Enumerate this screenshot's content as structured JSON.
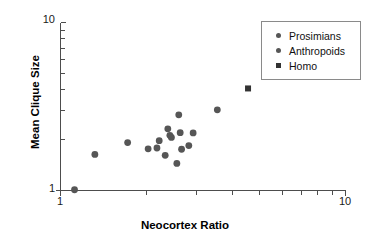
{
  "chart_data": {
    "type": "scatter",
    "title": "",
    "xlabel": "Neocortex Ratio",
    "ylabel": "Mean Clique Size",
    "xscale": "log",
    "yscale": "log",
    "xlim": [
      1,
      10
    ],
    "ylim": [
      1,
      10
    ],
    "grid": false,
    "xticks": [
      1,
      10
    ],
    "xtick_labels": [
      "1",
      "10"
    ],
    "xminor_ticks": [
      2,
      3,
      4,
      5,
      6,
      7,
      8,
      9
    ],
    "yticks": [
      1,
      10
    ],
    "ytick_labels": [
      "1",
      "10"
    ],
    "yminor_ticks": [
      2,
      3,
      4,
      5,
      6,
      7,
      8,
      9
    ],
    "legend_position": "upper right",
    "series": [
      {
        "name": "Prosimians",
        "marker": "circle",
        "color": "#565656",
        "points": [
          {
            "x": 1.12,
            "y": 1.01
          },
          {
            "x": 1.32,
            "y": 1.64
          },
          {
            "x": 1.72,
            "y": 1.93
          }
        ]
      },
      {
        "name": "Anthropoids",
        "marker": "circle",
        "color": "#565656",
        "points": [
          {
            "x": 2.03,
            "y": 1.77
          },
          {
            "x": 2.18,
            "y": 1.79
          },
          {
            "x": 2.22,
            "y": 1.98
          },
          {
            "x": 2.33,
            "y": 1.62
          },
          {
            "x": 2.38,
            "y": 2.33
          },
          {
            "x": 2.42,
            "y": 2.13
          },
          {
            "x": 2.45,
            "y": 2.07
          },
          {
            "x": 2.56,
            "y": 1.45
          },
          {
            "x": 2.6,
            "y": 2.82
          },
          {
            "x": 2.63,
            "y": 2.21
          },
          {
            "x": 2.66,
            "y": 1.76
          },
          {
            "x": 2.82,
            "y": 1.85
          },
          {
            "x": 2.92,
            "y": 2.2
          },
          {
            "x": 3.55,
            "y": 3.02
          }
        ]
      },
      {
        "name": "Homo",
        "marker": "square",
        "color": "#333333",
        "points": [
          {
            "x": 4.55,
            "y": 4.05
          }
        ]
      }
    ]
  },
  "legend": {
    "items": [
      {
        "label": "Prosimians",
        "marker": "circle"
      },
      {
        "label": "Anthropoids",
        "marker": "circle"
      },
      {
        "label": "Homo",
        "marker": "square"
      }
    ]
  },
  "axes": {
    "y_top_label": "10",
    "y_bottom_label": "1",
    "x_left_label": "1",
    "x_right_label": "10",
    "x_title": "Neocortex Ratio",
    "y_title": "Mean Clique Size"
  }
}
